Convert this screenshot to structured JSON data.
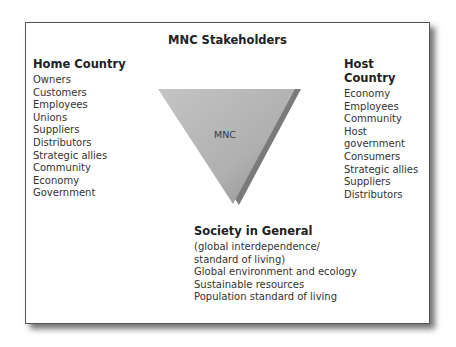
{
  "title": "MNC Stakeholders",
  "center": {
    "label": "MNC"
  },
  "home_country": {
    "heading": "Home Country",
    "items": [
      "Owners",
      "Customers",
      "Employees",
      "Unions",
      "Suppliers",
      "Distributors",
      "Strategic allies",
      "Community",
      "Economy",
      "Government"
    ]
  },
  "host_country": {
    "heading": "Host Country",
    "items": [
      "Economy",
      "Employees",
      "Community",
      "Host government",
      "Consumers",
      "Strategic allies",
      "Suppliers",
      "Distributors"
    ]
  },
  "society": {
    "heading": "Society in General",
    "items": [
      "(global interdependence/",
      "standard of living)",
      "Global environment and ecology",
      "Sustainable resources",
      "Population standard of living"
    ]
  },
  "colors": {
    "triangle_light": "#c8c8c8",
    "triangle_dark": "#9a9a9a",
    "shadow": "#6e6e6e",
    "border": "#555555"
  }
}
